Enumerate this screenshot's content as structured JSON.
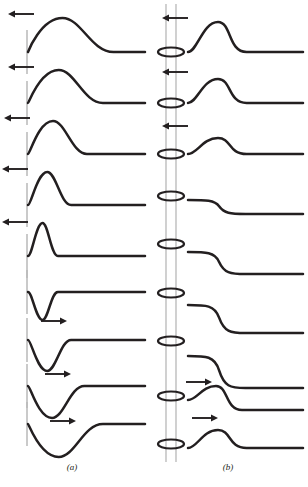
{
  "figure": {
    "background_color": "#ffffff",
    "stroke_color": "#231f20",
    "rail_color": "#bdbdbd",
    "tick_color": "#b9b9b9",
    "width": 308,
    "height": 487,
    "panels": [
      {
        "id": "a",
        "caption": "(a)",
        "caption_x": 72,
        "caption_y": 470,
        "row_count": 9,
        "baseline_x_start": 28,
        "baseline_x_end": 145,
        "rows": [
          {
            "index": 0,
            "baseline_y": 52,
            "polarity": "positive",
            "amplitude": 34,
            "width": 30,
            "arrow_direction": "left",
            "arrow_x": 34,
            "arrow_y": 14,
            "arrow_length": 26,
            "tick": true
          },
          {
            "index": 1,
            "baseline_y": 103,
            "polarity": "positive",
            "amplitude": 33,
            "width": 26,
            "arrow_direction": "left",
            "arrow_x": 34,
            "arrow_y": 67,
            "arrow_length": 26,
            "tick": true
          },
          {
            "index": 2,
            "baseline_y": 154,
            "polarity": "positive",
            "amplitude": 33,
            "width": 20,
            "arrow_direction": "left",
            "arrow_x": 30,
            "arrow_y": 118,
            "arrow_length": 26,
            "tick": true
          },
          {
            "index": 3,
            "baseline_y": 205,
            "polarity": "positive",
            "amplitude": 33,
            "width": 14,
            "arrow_direction": "left",
            "arrow_x": 28,
            "arrow_y": 169,
            "arrow_length": 26,
            "tick": true
          },
          {
            "index": 4,
            "baseline_y": 256,
            "polarity": "positive",
            "amplitude": 33,
            "width": 9,
            "arrow_direction": "left",
            "arrow_x": 28,
            "arrow_y": 222,
            "arrow_length": 26,
            "tick": true
          },
          {
            "index": 5,
            "baseline_y": 292,
            "polarity": "negative",
            "amplitude": 28,
            "width": 9,
            "arrow_direction": "right",
            "arrow_x": 41,
            "arrow_y": 321,
            "arrow_length": 26,
            "tick": true
          },
          {
            "index": 6,
            "baseline_y": 340,
            "polarity": "negative",
            "amplitude": 31,
            "width": 14,
            "arrow_direction": "right",
            "arrow_x": 45,
            "arrow_y": 374,
            "arrow_length": 26,
            "tick": true
          },
          {
            "index": 7,
            "baseline_y": 386,
            "polarity": "negative",
            "amplitude": 32,
            "width": 19,
            "arrow_direction": "right",
            "arrow_x": 50,
            "arrow_y": 421,
            "arrow_length": 26,
            "tick": true
          },
          {
            "index": 8,
            "baseline_y": 424,
            "polarity": "negative",
            "amplitude": 33,
            "width": 26,
            "arrow_direction": "none",
            "arrow_x": 0,
            "arrow_y": 0,
            "arrow_length": 0,
            "tick": true
          }
        ]
      },
      {
        "id": "b",
        "caption": "(b)",
        "caption_x": 228,
        "caption_y": 470,
        "row_count": 9,
        "baseline_x_start": 188,
        "baseline_x_end": 303,
        "rail": {
          "x_left": 166,
          "x_right": 176,
          "y_top": 4,
          "y_bottom": 462
        },
        "ring": {
          "rx": 13,
          "ry": 4.5,
          "cx": 171
        },
        "rows": [
          {
            "index": 0,
            "baseline_y": 52,
            "shape": "bump",
            "amplitude": 30,
            "width": 22,
            "step": 0,
            "arrow_direction": "left",
            "arrow_x": 188,
            "arrow_y": 18,
            "arrow_length": 26,
            "ring_y": 52
          },
          {
            "index": 1,
            "baseline_y": 103,
            "shape": "bump",
            "amplitude": 24,
            "width": 22,
            "step": 0,
            "arrow_direction": "left",
            "arrow_x": 188,
            "arrow_y": 72,
            "arrow_length": 26,
            "ring_y": 103
          },
          {
            "index": 2,
            "baseline_y": 154,
            "shape": "bump",
            "amplitude": 16,
            "width": 22,
            "step": 0,
            "arrow_direction": "left",
            "arrow_x": 188,
            "arrow_y": 126,
            "arrow_length": 26,
            "ring_y": 154
          },
          {
            "index": 3,
            "baseline_y": 200,
            "shape": "step",
            "amplitude": 0,
            "width": 22,
            "step": 14,
            "arrow_direction": "none",
            "arrow_x": 0,
            "arrow_y": 0,
            "arrow_length": 0,
            "ring_y": 196
          },
          {
            "index": 4,
            "baseline_y": 252,
            "shape": "step",
            "amplitude": 0,
            "width": 22,
            "step": 22,
            "arrow_direction": "none",
            "arrow_x": 0,
            "arrow_y": 0,
            "arrow_length": 0,
            "ring_y": 244
          },
          {
            "index": 5,
            "baseline_y": 305,
            "shape": "step",
            "amplitude": 0,
            "width": 22,
            "step": 28,
            "arrow_direction": "none",
            "arrow_x": 0,
            "arrow_y": 0,
            "arrow_length": 0,
            "ring_y": 293
          },
          {
            "index": 6,
            "baseline_y": 356,
            "shape": "step",
            "amplitude": 0,
            "width": 22,
            "step": 32,
            "arrow_direction": "none",
            "arrow_x": 0,
            "arrow_y": 0,
            "arrow_length": 0,
            "ring_y": 341
          },
          {
            "index": 7,
            "baseline_y": 400,
            "shape": "bump-step",
            "amplitude": 14,
            "width": 20,
            "step": 10,
            "arrow_direction": "right",
            "arrow_x": 186,
            "arrow_y": 382,
            "arrow_length": 26,
            "ring_y": 396
          },
          {
            "index": 8,
            "baseline_y": 448,
            "shape": "bump",
            "amplitude": 18,
            "width": 22,
            "step": 0,
            "arrow_direction": "right",
            "arrow_x": 192,
            "arrow_y": 418,
            "arrow_length": 26,
            "ring_y": 444
          }
        ]
      }
    ]
  }
}
